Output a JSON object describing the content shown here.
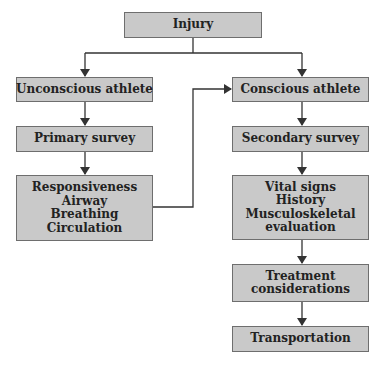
{
  "diagram": {
    "type": "flowchart",
    "colors": {
      "box_fill": "#c9c9c9",
      "box_border": "#6e6e6e",
      "line": "#333333",
      "text": "#222222"
    },
    "nodes": {
      "injury": {
        "lines": [
          "Injury"
        ]
      },
      "unconscious": {
        "lines": [
          "Unconscious athlete"
        ]
      },
      "conscious": {
        "lines": [
          "Conscious athlete"
        ]
      },
      "primary": {
        "lines": [
          "Primary survey"
        ]
      },
      "secondary": {
        "lines": [
          "Secondary survey"
        ]
      },
      "abc": {
        "lines": [
          "Responsiveness",
          "Airway",
          "Breathing",
          "Circulation"
        ]
      },
      "vitals": {
        "lines": [
          "Vital signs",
          "History",
          "Musculoskeletal",
          "evaluation"
        ]
      },
      "treatment": {
        "lines": [
          "Treatment",
          "considerations"
        ]
      },
      "transport": {
        "lines": [
          "Transportation"
        ]
      }
    },
    "edges": [
      {
        "from": "injury",
        "to": "unconscious"
      },
      {
        "from": "injury",
        "to": "conscious"
      },
      {
        "from": "unconscious",
        "to": "primary"
      },
      {
        "from": "primary",
        "to": "abc"
      },
      {
        "from": "abc",
        "to": "conscious"
      },
      {
        "from": "conscious",
        "to": "secondary"
      },
      {
        "from": "secondary",
        "to": "vitals"
      },
      {
        "from": "vitals",
        "to": "treatment"
      },
      {
        "from": "treatment",
        "to": "transport"
      }
    ]
  }
}
